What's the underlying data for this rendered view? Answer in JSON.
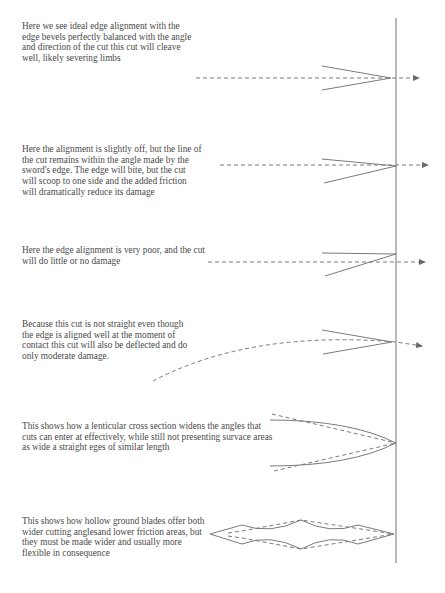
{
  "diagram": {
    "notes": [
      {
        "id": "ideal-alignment",
        "text": "Here we see ideal edge alignment with the\nedge bevels perfectly balanced with the angle\nand direction of the cut this cut will cleave\nwell, likely severing limbs"
      },
      {
        "id": "slightly-off",
        "text": "Here the alignment is slightly off, but the line of\nthe cut remains within the angle made by the\nsword's edge.  The edge will bite, but the cut\nwill scoop to one side and the added friction\nwill dramatically reduce its damage"
      },
      {
        "id": "very-poor",
        "text": "Here the edge alignment is very poor, and the cut\nwill do little or no damage"
      },
      {
        "id": "curved-cut",
        "text": "Because this cut is not straight even though\nthe edge is aligned well at the moment of\ncontact this cut will also be deflected and do\nonly moderate damage."
      },
      {
        "id": "lenticular",
        "text": "This shows how a lenticular cross section widens the angles that\ncuts can enter at effectively, while still not presenting survace areas\nas wide a straight eges of similar length"
      },
      {
        "id": "hollow-ground",
        "text": "This shows how hollow ground blades offer both\nwider cutting anglesand lower friction areas, but\nthey must be made wider and usually more\nflexible in consequence"
      }
    ],
    "colors": {
      "text": "#4a4a4a",
      "lines": "#7a7a7a",
      "target_line": "#8a8a8a",
      "background": "#ffffff"
    }
  }
}
